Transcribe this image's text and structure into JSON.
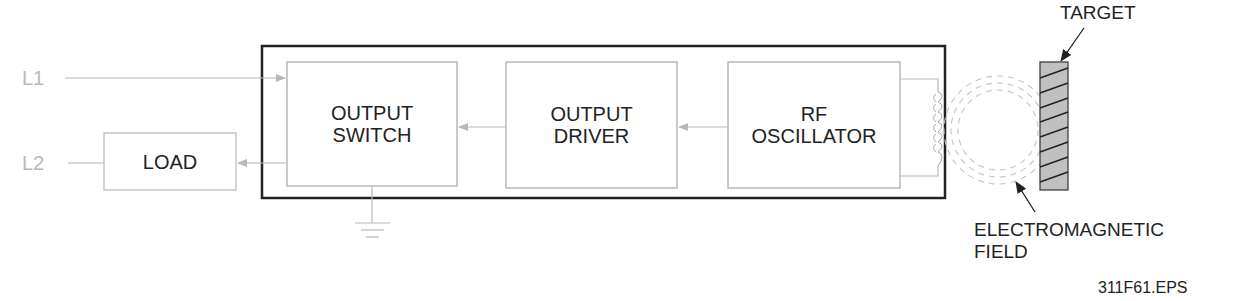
{
  "diagram": {
    "inputs": {
      "l1": "L1",
      "l2": "L2"
    },
    "blocks": {
      "load": "LOAD",
      "output_switch": [
        "OUTPUT",
        "SWITCH"
      ],
      "output_driver": [
        "OUTPUT",
        "DRIVER"
      ],
      "rf_oscillator": [
        "RF",
        "OSCILLATOR"
      ]
    },
    "labels": {
      "target": "TARGET",
      "field": [
        "ELECTROMAGNETIC",
        "FIELD"
      ],
      "figure_id": "311F61.EPS"
    },
    "colors": {
      "line_grey": "#b8b8b8",
      "frame": "#222222",
      "target_fill": "#c0c0c0"
    }
  }
}
